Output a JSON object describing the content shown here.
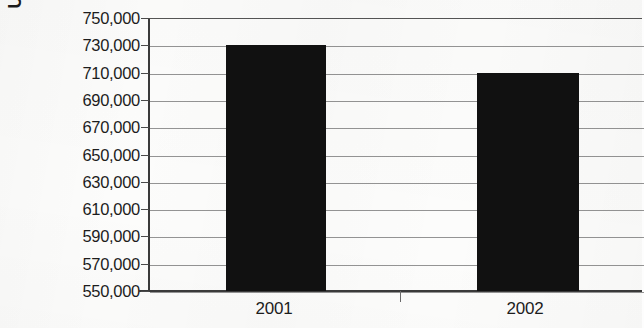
{
  "chart_data": {
    "type": "bar",
    "title": "",
    "xlabel": "",
    "ylabel": "U.S. Dollar (Thousands)",
    "categories": [
      "2001",
      "2002"
    ],
    "values": [
      730500,
      710000
    ],
    "series": [
      {
        "name": "U.S. Dollar (Thousands)",
        "values": [
          730500,
          710000
        ]
      }
    ],
    "ylim": [
      550000,
      750000
    ],
    "ytick_labels": [
      "750,000",
      "730,000",
      "710,000",
      "690,000",
      "670,000",
      "650,000",
      "630,000",
      "610,000",
      "590,000",
      "570,000",
      "550,000"
    ],
    "ytick_values": [
      750000,
      730000,
      710000,
      690000,
      670000,
      650000,
      630000,
      610000,
      590000,
      570000,
      550000
    ],
    "ytick_step": 20000,
    "grid": true,
    "grid_axis": "y",
    "legend": false,
    "legend_position": "none",
    "bar_color": "#111111",
    "gridline_color": "#7d7d7d",
    "axis_color": "#3a3a3a",
    "background_color": "#fcfcfb",
    "text_color": "#1d1d1d"
  }
}
